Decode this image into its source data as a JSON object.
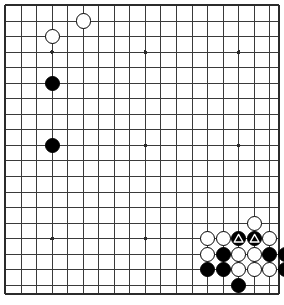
{
  "diagram": {
    "kind": "go-board-diagram",
    "board_size": 19,
    "colors": {
      "background": "#ffffff",
      "line": "#3a3a3a",
      "border": "#2b2b2b",
      "black_stone": "#000000",
      "white_stone": "#ffffff",
      "stone_outline": "#000000",
      "marker": "#ffffff"
    },
    "geometry": {
      "origin_x": 21,
      "origin_y": 21,
      "cell": 15.55,
      "cols_visible": 18,
      "rows_visible": 18,
      "stone_radius": 7.6,
      "hoshi_radius": 1.9,
      "border_left": 5,
      "border_top": 5,
      "border_right": 279,
      "border_bottom": 294
    },
    "star_points": [
      {
        "col": 2,
        "row": 2
      },
      {
        "col": 8,
        "row": 2
      },
      {
        "col": 14,
        "row": 2
      },
      {
        "col": 2,
        "row": 8
      },
      {
        "col": 8,
        "row": 8
      },
      {
        "col": 14,
        "row": 8
      },
      {
        "col": 2,
        "row": 14
      },
      {
        "col": 8,
        "row": 14
      }
    ],
    "stones": [
      {
        "col": 2,
        "row": 1,
        "color": "white",
        "marker": "none",
        "label": "white-stone-upper-left-corner"
      },
      {
        "col": 4,
        "row": 0,
        "color": "white",
        "marker": "none",
        "label": "white-stone-upper-left-high"
      },
      {
        "col": 2,
        "row": 4,
        "color": "black",
        "marker": "none",
        "label": "black-stone-left-upper"
      },
      {
        "col": 2,
        "row": 8,
        "color": "black",
        "marker": "none",
        "label": "black-stone-left-star"
      },
      {
        "col": 15,
        "row": 13,
        "color": "white",
        "marker": "none",
        "label": "white-stone-lower-right-high"
      },
      {
        "col": 12,
        "row": 14,
        "color": "white",
        "marker": "none",
        "label": "white-stone-row14-c12"
      },
      {
        "col": 13,
        "row": 14,
        "color": "white",
        "marker": "none",
        "label": "white-stone-row14-c13"
      },
      {
        "col": 14,
        "row": 14,
        "color": "black",
        "marker": "triangle",
        "label": "black-stone-marked-row14-c14"
      },
      {
        "col": 15,
        "row": 14,
        "color": "black",
        "marker": "triangle",
        "label": "black-stone-marked-row14-c15"
      },
      {
        "col": 16,
        "row": 14,
        "color": "white",
        "marker": "none",
        "label": "white-stone-row14-c16"
      },
      {
        "col": 12,
        "row": 15,
        "color": "white",
        "marker": "none",
        "label": "white-stone-row15-c12"
      },
      {
        "col": 13,
        "row": 15,
        "color": "black",
        "marker": "none",
        "label": "black-stone-row15-c13"
      },
      {
        "col": 14,
        "row": 15,
        "color": "white",
        "marker": "none",
        "label": "white-stone-row15-c14"
      },
      {
        "col": 15,
        "row": 15,
        "color": "white",
        "marker": "none",
        "label": "white-stone-row15-c15"
      },
      {
        "col": 16,
        "row": 15,
        "color": "black",
        "marker": "none",
        "label": "black-stone-row15-c16"
      },
      {
        "col": 17,
        "row": 15,
        "color": "black",
        "marker": "none",
        "label": "black-stone-row15-c17"
      },
      {
        "col": 12,
        "row": 16,
        "color": "black",
        "marker": "none",
        "label": "black-stone-row16-c12"
      },
      {
        "col": 13,
        "row": 16,
        "color": "black",
        "marker": "none",
        "label": "black-stone-row16-c13"
      },
      {
        "col": 14,
        "row": 16,
        "color": "white",
        "marker": "none",
        "label": "white-stone-row16-c14"
      },
      {
        "col": 15,
        "row": 16,
        "color": "white",
        "marker": "none",
        "label": "white-stone-row16-c15"
      },
      {
        "col": 16,
        "row": 16,
        "color": "white",
        "marker": "none",
        "label": "white-stone-row16-c16"
      },
      {
        "col": 17,
        "row": 16,
        "color": "black",
        "marker": "none",
        "label": "black-stone-row16-c17"
      },
      {
        "col": 14,
        "row": 17,
        "color": "black",
        "marker": "none",
        "label": "black-stone-bottom-edge"
      }
    ]
  }
}
